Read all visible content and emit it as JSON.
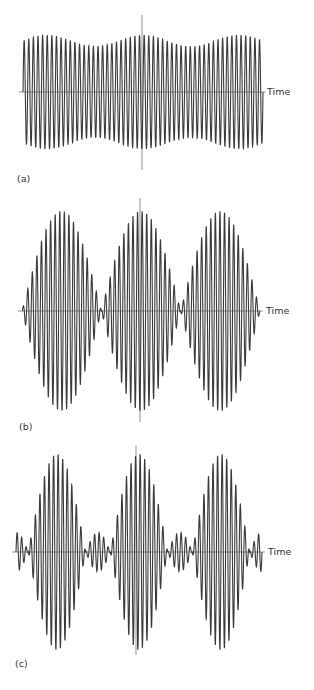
{
  "figure": {
    "axis_label": "Time",
    "panel_labels": [
      "(a)",
      "(b)",
      "(c)"
    ]
  },
  "colors": {
    "waveform": "#3a3a3a",
    "axis": "#7a7a7a",
    "background": "#ffffff"
  },
  "chart_data": [
    {
      "type": "line",
      "title": "",
      "panel": "(a)",
      "xlabel": "Time",
      "ylabel": "",
      "grid": false,
      "description": "Nearly constant-amplitude oscillation with slight slow amplitude variation (weak beating)",
      "carrier_cycles": 52,
      "envelope": "weak modulation, amplitude ~0.8 to 1.0",
      "envelope_peaks_x_fraction": [
        0.1,
        0.5,
        0.9
      ],
      "min_relative_amplitude": 0.8,
      "max_relative_amplitude": 1.0
    },
    {
      "type": "line",
      "title": "",
      "panel": "(b)",
      "xlabel": "Time",
      "ylabel": "",
      "grid": false,
      "description": "Full beating: amplitude envelope goes to zero between three lobes",
      "carrier_cycles": 52,
      "envelope": "|cos| modulation, 3 lobes",
      "lobe_count": 3,
      "min_relative_amplitude": 0.0,
      "max_relative_amplitude": 1.0
    },
    {
      "type": "line",
      "title": "",
      "panel": "(c)",
      "xlabel": "Time",
      "ylabel": "",
      "grid": false,
      "description": "Three large lobes separated by small secondary lobes (four small lobes)",
      "carrier_cycles": 54,
      "envelope": "large lobes amplitude 1.0 alternating with small lobes amplitude ~0.2",
      "large_lobe_count": 3,
      "small_lobe_count": 4,
      "large_lobe_relative_amplitude": 1.0,
      "small_lobe_relative_amplitude": 0.2
    }
  ]
}
